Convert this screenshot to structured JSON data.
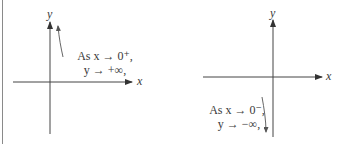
{
  "panels": [
    {
      "name": "left",
      "axis_x_label": "x",
      "axis_y_label": "y",
      "caption_line1": "As x → 0⁺,",
      "caption_line2": "y → +∞,",
      "behavior": "curve rises toward +infinity near y-axis from the right"
    },
    {
      "name": "right",
      "axis_x_label": "x",
      "axis_y_label": "y",
      "caption_line1": "As x → 0⁻,",
      "caption_line2": "y → −∞,",
      "behavior": "curve falls toward -infinity near y-axis from the left"
    }
  ],
  "colors": {
    "ink": "#3a3a3a",
    "background": "#ffffff",
    "border": "#888888"
  }
}
